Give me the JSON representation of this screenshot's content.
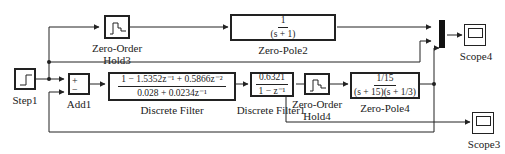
{
  "diagram": {
    "type": "simulink-block-diagram",
    "blocks": {
      "step1": {
        "label": "Step1",
        "icon": "step-icon"
      },
      "add1": {
        "label": "Add1",
        "signs": [
          "+",
          "−"
        ]
      },
      "zoh3": {
        "label_line1": "Zero-Order",
        "label_line2": "Hold3",
        "icon": "staircase-icon"
      },
      "zp2": {
        "label": "Zero-Pole2",
        "num": "1",
        "den": "(s + 1)"
      },
      "df": {
        "label": "Discrete Filter",
        "num": "1 − 1.5352z⁻¹ + 0.5866z⁻²",
        "den": "0.028 + 0.0234z⁻¹"
      },
      "df1": {
        "label": "Discrete Filter1",
        "num": "0.6321",
        "den": "1 − z⁻¹"
      },
      "zoh4": {
        "label_line1": "Zero-Order",
        "label_line2": "Hold4",
        "icon": "staircase-icon"
      },
      "zp4": {
        "label": "Zero-Pole4",
        "num": "1/15",
        "den": "(s + 15)(s + 1/3)"
      },
      "mux": {
        "label": "",
        "inputs": 3
      },
      "scope4": {
        "label": "Scope4",
        "icon": "scope-icon"
      },
      "scope3": {
        "label": "Scope3",
        "icon": "scope-icon"
      }
    },
    "colors": {
      "line": "#222222",
      "background": "#ffffff"
    }
  }
}
